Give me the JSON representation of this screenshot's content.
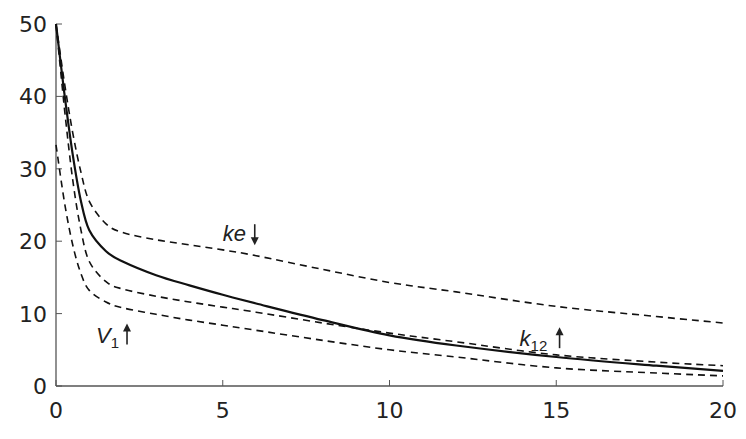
{
  "chart_data": {
    "type": "line",
    "title": "",
    "xlabel": "",
    "ylabel": "",
    "xlim": [
      0,
      20
    ],
    "ylim": [
      0,
      50
    ],
    "x_ticks": [
      0,
      5,
      10,
      15,
      20
    ],
    "y_ticks": [
      0,
      10,
      20,
      30,
      40,
      50
    ],
    "grid": false,
    "legend": null,
    "series": [
      {
        "name": "baseline",
        "style": "solid",
        "x": [
          0,
          0.25,
          0.5,
          0.75,
          1,
          1.5,
          2,
          3,
          4,
          5,
          6,
          8,
          10,
          12,
          15,
          18,
          20
        ],
        "values": [
          50,
          40.5,
          32,
          25.5,
          21.5,
          18.6,
          17.2,
          15.3,
          13.9,
          12.6,
          11.4,
          9.1,
          7.0,
          5.6,
          4.0,
          2.8,
          2.1
        ]
      },
      {
        "name": "ke↓",
        "style": "dashed",
        "x": [
          0,
          0.25,
          0.5,
          0.75,
          1,
          1.5,
          2,
          3,
          4,
          5,
          6,
          8,
          10,
          12,
          15,
          18,
          20
        ],
        "values": [
          50,
          42,
          35,
          29.5,
          25.5,
          22.4,
          21.2,
          20.2,
          19.5,
          18.8,
          18.0,
          16.1,
          14.3,
          13.0,
          11.0,
          9.6,
          8.7
        ]
      },
      {
        "name": "k12↑",
        "style": "dashed",
        "x": [
          0,
          0.25,
          0.5,
          0.75,
          1,
          1.5,
          2,
          3,
          4,
          5,
          6,
          8,
          10,
          12,
          15,
          18,
          20
        ],
        "values": [
          50,
          38.5,
          28.5,
          21.5,
          17.2,
          14.4,
          13.4,
          12.4,
          11.6,
          10.9,
          10.2,
          8.7,
          7.3,
          6.1,
          4.3,
          3.3,
          2.8
        ]
      },
      {
        "name": "V1↑",
        "style": "dashed",
        "x": [
          0,
          0.25,
          0.5,
          0.75,
          1,
          1.5,
          2,
          3,
          4,
          5,
          6,
          8,
          10,
          12,
          15,
          18,
          20
        ],
        "values": [
          33.3,
          25.5,
          19.5,
          15.5,
          13.2,
          11.6,
          10.8,
          9.9,
          9.1,
          8.4,
          7.7,
          6.3,
          5.0,
          4.0,
          2.5,
          1.8,
          1.4
        ]
      }
    ],
    "annotations": [
      {
        "text": "ke",
        "arrow": "down",
        "x": 5.0,
        "y": 20.0
      },
      {
        "text": "V",
        "subscript": "1",
        "arrow": "up",
        "x": 1.2,
        "y": 6.0
      },
      {
        "text": "k",
        "subscript": "12",
        "arrow": "up",
        "x": 13.9,
        "y": 5.5
      }
    ]
  },
  "plot_area": {
    "x0_px": 56,
    "x1_px": 723,
    "y0_px": 386,
    "y1_px": 24
  },
  "colors": {
    "axis": "#555555",
    "line": "#111111",
    "text": "#222222"
  }
}
